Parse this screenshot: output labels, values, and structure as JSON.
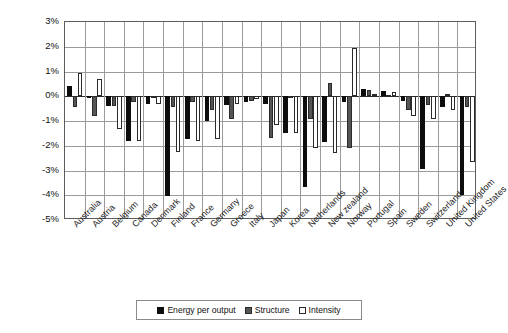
{
  "chart_data": {
    "type": "bar",
    "title": "",
    "xlabel": "",
    "ylabel": "Average annual percent change",
    "ylim": [
      -5,
      3
    ],
    "yticks": [
      "3%",
      "2%",
      "1%",
      "0%",
      "-1%",
      "-2%",
      "-3%",
      "-4%",
      "-5%"
    ],
    "grid": true,
    "legend_position": "bottom",
    "categories": [
      "Australia",
      "Austria",
      "Belgium",
      "Canada",
      "Denmark",
      "Finland",
      "France",
      "Germany",
      "Greece",
      "Italy",
      "Japan",
      "Korea",
      "Netherlands",
      "New zealand",
      "Norway",
      "Portugal",
      "Spain",
      "Sweden",
      "Switzerland",
      "United Kingdom",
      "United States"
    ],
    "series": [
      {
        "name": "Energy per output",
        "values": [
          0.42,
          -0.05,
          -0.4,
          -1.82,
          -0.3,
          -4.05,
          -1.72,
          -1.0,
          -0.35,
          -0.25,
          -0.3,
          -1.5,
          -3.65,
          -1.85,
          -0.25,
          0.28,
          0.2,
          -0.18,
          -2.95,
          -0.45,
          -4.0
        ]
      },
      {
        "name": "Structure",
        "values": [
          -0.45,
          -0.8,
          -0.4,
          -0.22,
          0.0,
          -0.42,
          -0.25,
          -0.55,
          -0.9,
          -0.18,
          -1.7,
          -0.05,
          -0.9,
          0.55,
          -2.1,
          0.25,
          0.06,
          -0.55,
          -0.35,
          0.08,
          -0.42
        ]
      },
      {
        "name": "Intensity",
        "values": [
          0.92,
          0.68,
          -1.32,
          -1.8,
          -0.33,
          -2.25,
          -1.82,
          -1.72,
          -0.3,
          -0.1,
          -1.18,
          -1.5,
          -2.1,
          -2.3,
          1.95,
          0.1,
          0.17,
          -0.8,
          -0.9,
          -0.55,
          -2.65
        ]
      }
    ]
  },
  "legend": {
    "items": [
      {
        "label": "Energy per output",
        "swatch": "black"
      },
      {
        "label": "Structure",
        "swatch": "gray"
      },
      {
        "label": "Intensity",
        "swatch": "white"
      }
    ]
  }
}
